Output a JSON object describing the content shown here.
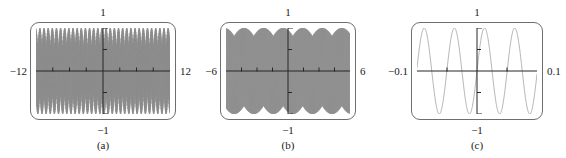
{
  "figure": {
    "background": "#ffffff",
    "curve_color": "#8c8c8c",
    "axis_color": "#262626",
    "frame_color": "#6e6e6e",
    "text_color": "#1a1a1a"
  },
  "panels": [
    {
      "caption": "(a)",
      "x_left_label": "−12",
      "x_right_label": "12",
      "y_top_label": "1",
      "y_bottom_label": "−1",
      "frame": {
        "x": 30,
        "y": 22,
        "w": 146,
        "h": 98
      },
      "caption_x": 103,
      "caption_y": 140
    },
    {
      "caption": "(b)",
      "x_left_label": "−6",
      "x_right_label": "6",
      "y_top_label": "1",
      "y_bottom_label": "−1",
      "frame": {
        "x": 220,
        "y": 22,
        "w": 136,
        "h": 98
      },
      "caption_x": 288,
      "caption_y": 140
    },
    {
      "caption": "(c)",
      "x_left_label": "−0.1",
      "x_right_label": "0.1",
      "y_top_label": "1",
      "y_bottom_label": "−1",
      "frame": {
        "x": 411,
        "y": 22,
        "w": 132,
        "h": 98
      },
      "caption_x": 477,
      "caption_y": 140
    }
  ],
  "chart_data": [
    {
      "type": "line",
      "title": "",
      "panel": "(a)",
      "function": "sin(125x)",
      "xlabel": "",
      "ylabel": "",
      "xlim": [
        -12,
        12
      ],
      "ylim": [
        -1,
        1
      ],
      "xticks": [
        -9,
        -6,
        -3,
        0,
        3,
        6,
        9
      ],
      "yticks": [
        -0.5,
        0,
        0.5
      ],
      "xtick_labels": [
        "−12",
        "12"
      ],
      "ytick_labels": [
        "1",
        "−1"
      ],
      "grid": false,
      "legend": false,
      "samples": 1400,
      "frequency": 125,
      "amplitude": 1,
      "note": "Aliased / dense oscillation filling the window"
    },
    {
      "type": "line",
      "title": "",
      "panel": "(b)",
      "function": "sin(125x)",
      "xlabel": "",
      "ylabel": "",
      "xlim": [
        -6,
        6
      ],
      "ylim": [
        -1,
        1
      ],
      "xticks": [
        -4.5,
        -3,
        -1.5,
        0,
        1.5,
        3,
        4.5
      ],
      "yticks": [
        -0.5,
        0,
        0.5
      ],
      "xtick_labels": [
        "−6",
        "6"
      ],
      "ytick_labels": [
        "1",
        "−1"
      ],
      "grid": false,
      "legend": false,
      "samples": 1200,
      "frequency": 125,
      "amplitude": 1,
      "note": "Aliased / dense oscillation filling the window"
    },
    {
      "type": "line",
      "title": "",
      "panel": "(c)",
      "function": "sin(125x)",
      "xlabel": "",
      "ylabel": "",
      "xlim": [
        -0.1,
        0.1
      ],
      "ylim": [
        -1,
        1
      ],
      "xticks": [
        -0.05,
        0,
        0.05
      ],
      "yticks": [
        -0.5,
        0,
        0.5
      ],
      "xtick_labels": [
        "−0.1",
        "0.1"
      ],
      "ytick_labels": [
        "1",
        "−1"
      ],
      "grid": false,
      "legend": false,
      "samples": 600,
      "frequency": 125,
      "amplitude": 1,
      "note": "Smooth sine, about four full cycles visible"
    }
  ]
}
